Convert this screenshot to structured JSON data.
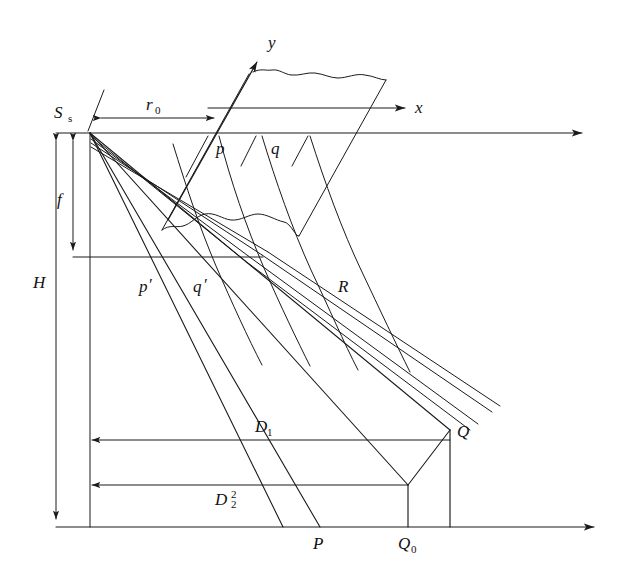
{
  "figure": {
    "background_color": "#ffffff",
    "line_color": "#1a1a1a",
    "text_color": "#111111"
  },
  "labels": {
    "source": "S",
    "source_sub": "s",
    "axis_y": "y",
    "axis_x": "x",
    "range_zero": "r",
    "range_zero_sub": "0",
    "focal": "f",
    "height": "H",
    "cell_p": "p",
    "cell_q": "q",
    "cell_p_proj": "p",
    "cell_p_proj_prime": "′",
    "cell_q_proj": "q",
    "cell_q_proj_prime": "′",
    "slant_range": "R",
    "dist_one": "D",
    "dist_one_sub": "1",
    "dist_two": "D",
    "dist_two_sub": "2",
    "dist_two_sup": "2",
    "point_P": "P",
    "point_Q": "Q",
    "point_Q0": "Q",
    "point_Q0_sub": "0"
  },
  "geometry": {
    "apex": {
      "x": 90,
      "y": 133
    },
    "ground_line_y": 527,
    "top_line_y": 133,
    "mid_line_y": 257,
    "h_arrow_x": 56,
    "f_arrow_x": 73,
    "vertical_axis_x": 90,
    "point_P_x": 320,
    "point_Q0_x": 408,
    "point_Q_x": 450,
    "point_Q_y": 430,
    "r0_y": 118,
    "r0_x_start": 100,
    "r0_x_end": 215,
    "d1_y": 440,
    "d2_y": 485,
    "x_axis_arrow_tip": {
      "x": 412,
      "y": 108
    },
    "y_axis_arrow_tip": {
      "x": 262,
      "y": 55
    },
    "horizon_arrow_tip": {
      "x": 588,
      "y": 133
    },
    "ground_arrow_tip": {
      "x": 600,
      "y": 527
    }
  }
}
